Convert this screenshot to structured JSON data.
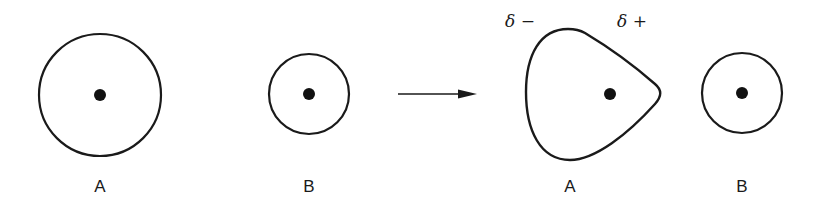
{
  "diagram": {
    "before": {
      "atom_a": {
        "label": "A"
      },
      "atom_b": {
        "label": "B"
      }
    },
    "arrow": {
      "direction": "right"
    },
    "after": {
      "atom_a": {
        "label": "A",
        "charge_left": "δ −",
        "charge_right": "δ +"
      },
      "atom_b": {
        "label": "B"
      }
    },
    "colors": {
      "stroke": "#1a1a1a",
      "background": "#ffffff"
    }
  }
}
